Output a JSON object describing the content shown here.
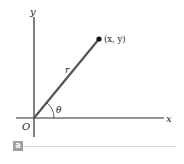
{
  "figure": {
    "axes": {
      "x_label": "x",
      "y_label": "y",
      "origin_label": "O"
    },
    "point_label": "(x, y)",
    "radius_label": "r",
    "angle_label": "θ",
    "panel_label": "a",
    "colors": {
      "axis": "#2a2a2a",
      "ray": "#555555",
      "badge": "#9e9e9e",
      "rule": "#d8d8d8"
    }
  }
}
